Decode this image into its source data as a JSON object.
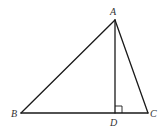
{
  "diagram": {
    "type": "triangle-with-altitude",
    "points": {
      "A": {
        "label": "A",
        "x": 115,
        "y": 20
      },
      "B": {
        "label": "B",
        "x": 21,
        "y": 113
      },
      "C": {
        "label": "C",
        "x": 148,
        "y": 113
      },
      "D": {
        "label": "D",
        "x": 115,
        "y": 113
      }
    },
    "segments": [
      "AB",
      "AC",
      "BC",
      "AD"
    ],
    "right_angle_at": "D",
    "colors": {
      "stroke": "#1a1a1a",
      "label": "#333333",
      "background": "#ffffff"
    }
  }
}
